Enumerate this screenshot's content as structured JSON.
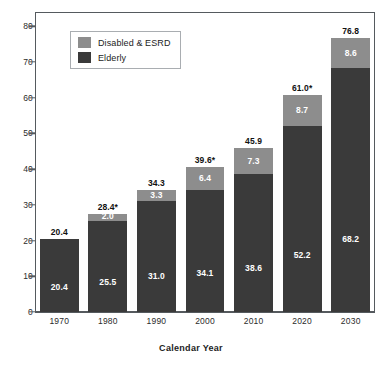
{
  "chart_data": {
    "type": "bar",
    "subtype": "stacked-vertical",
    "title": "",
    "xlabel": "Calendar Year",
    "ylabel": "",
    "categories": [
      "1970",
      "1980",
      "1990",
      "2000",
      "2010",
      "2020",
      "2030"
    ],
    "series": [
      {
        "name": "Elderly",
        "color": "#3a3a3a",
        "values": [
          20.4,
          25.5,
          31.0,
          34.1,
          38.6,
          52.2,
          68.2
        ],
        "labels": [
          "20.4",
          "25.5",
          "31.0",
          "34.1",
          "38.6",
          "52.2",
          "68.2"
        ]
      },
      {
        "name": "Disabled & ESRD",
        "color": "#8d8d8d",
        "values": [
          0.0,
          2.0,
          3.3,
          6.4,
          7.3,
          8.7,
          8.6
        ],
        "labels": [
          "",
          "2.0",
          "3.3",
          "6.4",
          "7.3",
          "8.7",
          "8.6"
        ]
      }
    ],
    "totals": [
      20.4,
      28.4,
      34.3,
      39.6,
      45.9,
      61.0,
      76.8
    ],
    "total_labels": [
      "20.4",
      "28.4*",
      "34.3",
      "39.6*",
      "45.9",
      "61.0*",
      "76.8"
    ],
    "ylim": [
      0,
      84
    ],
    "yticks": [
      0,
      10,
      20,
      30,
      40,
      50,
      60,
      70,
      80
    ],
    "ytick_labels": [
      "0",
      "10",
      "20",
      "30",
      "40",
      "50",
      "60",
      "70",
      "80"
    ],
    "grid": false,
    "legend_position": "top-left",
    "legend_entries": [
      {
        "label": "Disabled & ESRD",
        "color": "#8d8d8d"
      },
      {
        "label": "Elderly",
        "color": "#3a3a3a"
      }
    ]
  }
}
